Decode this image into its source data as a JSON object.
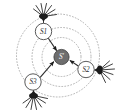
{
  "figure": {
    "background_color": "#ffffff",
    "width": 117,
    "height": 110
  },
  "palette": {
    "node_fill": "#ffffff",
    "node_stroke": "#4a4a4a",
    "center_node_fill": "#6e6e6e",
    "center_node_stroke": "#3a3a3a",
    "ring_stroke": "#9a9a9a",
    "link_stroke": "#2a2a2a",
    "burst_color": "#1c1c1c",
    "label_color": "#2b2b2b",
    "center_label_color": "#ffffff"
  },
  "nodes": [
    {
      "id": "s1",
      "label": "S1",
      "kind": "anchor",
      "cx": 43.5,
      "cy": 31.5,
      "r": 8.2,
      "filled": false
    },
    {
      "id": "s2",
      "label": "S2",
      "kind": "anchor",
      "cx": 86.0,
      "cy": 69.5,
      "r": 8.2,
      "filled": false
    },
    {
      "id": "s3",
      "label": "S3",
      "kind": "anchor",
      "cx": 33.0,
      "cy": 82.0,
      "r": 8.2,
      "filled": false
    },
    {
      "id": "s_target",
      "label": "S'",
      "kind": "target",
      "cx": 61.5,
      "cy": 57.0,
      "r": 7.6,
      "filled": true
    }
  ],
  "antennas": [
    {
      "id": "antenna-s1",
      "attached_to": "s1",
      "cx": 43.5,
      "cy": 16.5,
      "rays": 7,
      "spread_deg": 150,
      "orientation_deg": -90,
      "ray_length": 12
    },
    {
      "id": "antenna-s2",
      "attached_to": "s2",
      "cx": 99.5,
      "cy": 70.0,
      "rays": 7,
      "spread_deg": 150,
      "orientation_deg": 0,
      "ray_length": 12
    },
    {
      "id": "antenna-s3",
      "attached_to": "s3",
      "cx": 33.5,
      "cy": 95.5,
      "rays": 7,
      "spread_deg": 150,
      "orientation_deg": 90,
      "ray_length": 12
    }
  ],
  "links": [
    {
      "id": "link-s1-target",
      "from": "s1",
      "to": "s_target",
      "arrow": "to",
      "style": "solid"
    },
    {
      "id": "link-s2-target",
      "from": "s2",
      "to": "s_target",
      "arrow": "to",
      "style": "solid"
    },
    {
      "id": "link-s3-target",
      "from": "s3",
      "to": "s_target",
      "arrow": "to",
      "style": "solid"
    }
  ],
  "range_rings": [
    {
      "id": "ring-inner",
      "cx": 61.5,
      "cy": 57.0,
      "r": 19.5,
      "style": "dotted"
    },
    {
      "id": "ring-middle",
      "cx": 61.5,
      "cy": 57.0,
      "r": 29.5,
      "style": "dotted"
    },
    {
      "id": "ring-outer",
      "cx": 58.0,
      "cy": 55.5,
      "r": 41.5,
      "style": "dotted"
    }
  ],
  "labels": {
    "s1": "S1",
    "s2": "S2",
    "s3": "S3",
    "target": "S'"
  }
}
